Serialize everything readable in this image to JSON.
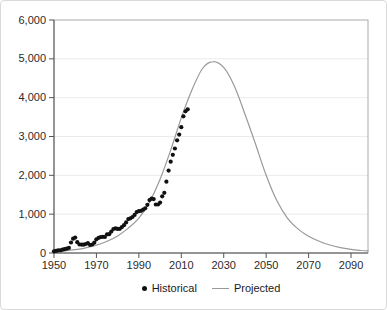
{
  "figure": {
    "legend": {
      "historical_label": "Historical",
      "projected_label": "Projected"
    }
  },
  "colors": {
    "historical": "#111111",
    "projected": "#999999",
    "frame": "#aaaaaa",
    "axis": "#555555",
    "grid": "#ebebeb",
    "tick_text": "#2b2b2b",
    "background": "#ffffff",
    "page_border": "#d9d9d9"
  },
  "chart_data": {
    "type": "scatter",
    "title": "",
    "xlabel": "",
    "ylabel": "",
    "xlim": [
      1950,
      2098
    ],
    "ylim": [
      0,
      6000
    ],
    "grid": "horizontal",
    "legend_position": "bottom-center",
    "x_ticks": [
      {
        "value": 1950,
        "label": "1950"
      },
      {
        "value": 1970,
        "label": "1970"
      },
      {
        "value": 1990,
        "label": "1990"
      },
      {
        "value": 2010,
        "label": "2010"
      },
      {
        "value": 2030,
        "label": "2030"
      },
      {
        "value": 2050,
        "label": "2050"
      },
      {
        "value": 2070,
        "label": "2070"
      },
      {
        "value": 2090,
        "label": "2090"
      }
    ],
    "y_ticks": [
      {
        "value": 0,
        "label": "0"
      },
      {
        "value": 1000,
        "label": "1,000"
      },
      {
        "value": 2000,
        "label": "2,000"
      },
      {
        "value": 3000,
        "label": "3,000"
      },
      {
        "value": 4000,
        "label": "4,000"
      },
      {
        "value": 5000,
        "label": "5,000"
      },
      {
        "value": 6000,
        "label": "6,000"
      }
    ],
    "series": [
      {
        "name": "Historical",
        "type": "scatter",
        "color": "#111111",
        "points": [
          [
            1950,
            45
          ],
          [
            1951,
            55
          ],
          [
            1952,
            66
          ],
          [
            1953,
            70
          ],
          [
            1954,
            84
          ],
          [
            1955,
            98
          ],
          [
            1956,
            110
          ],
          [
            1957,
            131
          ],
          [
            1958,
            270
          ],
          [
            1959,
            369
          ],
          [
            1960,
            397
          ],
          [
            1961,
            278
          ],
          [
            1962,
            220
          ],
          [
            1963,
            217
          ],
          [
            1964,
            215
          ],
          [
            1965,
            232
          ],
          [
            1966,
            252
          ],
          [
            1967,
            206
          ],
          [
            1968,
            220
          ],
          [
            1969,
            266
          ],
          [
            1970,
            354
          ],
          [
            1971,
            392
          ],
          [
            1972,
            410
          ],
          [
            1973,
            417
          ],
          [
            1974,
            413
          ],
          [
            1975,
            482
          ],
          [
            1976,
            483
          ],
          [
            1977,
            550
          ],
          [
            1978,
            618
          ],
          [
            1979,
            635
          ],
          [
            1980,
            620
          ],
          [
            1981,
            622
          ],
          [
            1982,
            666
          ],
          [
            1983,
            715
          ],
          [
            1984,
            789
          ],
          [
            1985,
            872
          ],
          [
            1986,
            894
          ],
          [
            1987,
            928
          ],
          [
            1988,
            980
          ],
          [
            1989,
            1054
          ],
          [
            1990,
            1080
          ],
          [
            1991,
            1087
          ],
          [
            1992,
            1116
          ],
          [
            1993,
            1150
          ],
          [
            1994,
            1240
          ],
          [
            1995,
            1361
          ],
          [
            1996,
            1397
          ],
          [
            1997,
            1388
          ],
          [
            1998,
            1250
          ],
          [
            1999,
            1250
          ],
          [
            2000,
            1299
          ],
          [
            2001,
            1459
          ],
          [
            2002,
            1550
          ],
          [
            2003,
            1835
          ],
          [
            2004,
            2123
          ],
          [
            2005,
            2350
          ],
          [
            2006,
            2529
          ],
          [
            2007,
            2692
          ],
          [
            2008,
            2903
          ],
          [
            2009,
            3050
          ],
          [
            2010,
            3240
          ],
          [
            2011,
            3520
          ],
          [
            2012,
            3650
          ],
          [
            2013,
            3700
          ]
        ]
      },
      {
        "name": "Projected",
        "type": "line",
        "color": "#999999",
        "points": [
          [
            1950,
            35
          ],
          [
            1955,
            55
          ],
          [
            1960,
            85
          ],
          [
            1965,
            135
          ],
          [
            1970,
            200
          ],
          [
            1975,
            300
          ],
          [
            1980,
            440
          ],
          [
            1985,
            640
          ],
          [
            1990,
            900
          ],
          [
            1995,
            1310
          ],
          [
            2000,
            1900
          ],
          [
            2005,
            2650
          ],
          [
            2010,
            3480
          ],
          [
            2015,
            4200
          ],
          [
            2020,
            4750
          ],
          [
            2025,
            4930
          ],
          [
            2030,
            4780
          ],
          [
            2035,
            4300
          ],
          [
            2040,
            3580
          ],
          [
            2045,
            2800
          ],
          [
            2050,
            2000
          ],
          [
            2055,
            1350
          ],
          [
            2060,
            900
          ],
          [
            2065,
            620
          ],
          [
            2070,
            430
          ],
          [
            2075,
            300
          ],
          [
            2080,
            205
          ],
          [
            2085,
            140
          ],
          [
            2090,
            95
          ],
          [
            2095,
            65
          ],
          [
            2098,
            55
          ]
        ]
      }
    ]
  }
}
